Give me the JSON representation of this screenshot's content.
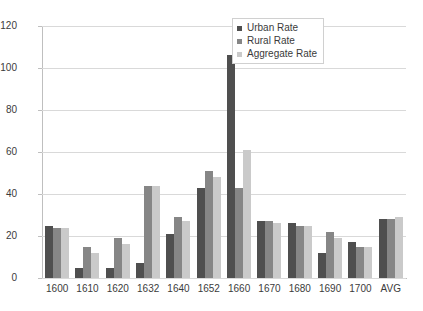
{
  "chart_data": {
    "type": "bar",
    "title": "",
    "xlabel": "",
    "ylabel": "",
    "ylim": [
      0,
      120
    ],
    "yticks": [
      0,
      20,
      40,
      60,
      80,
      100,
      120
    ],
    "grid": true,
    "legend_position": "top-right",
    "categories": [
      "1600",
      "1610",
      "1620",
      "1632",
      "1640",
      "1652",
      "1660",
      "1670",
      "1680",
      "1690",
      "1700",
      "AVG"
    ],
    "series": [
      {
        "name": "Urban Rate",
        "color": "#4f4f4f",
        "values": [
          25,
          5,
          5,
          7,
          21,
          43,
          106,
          27,
          26,
          12,
          17,
          28
        ]
      },
      {
        "name": "Rural Rate",
        "color": "#868686",
        "values": [
          24,
          15,
          19,
          44,
          29,
          51,
          43,
          27,
          25,
          22,
          15,
          28
        ]
      },
      {
        "name": "Aggregate Rate",
        "color": "#cacaca",
        "values": [
          24,
          12,
          16,
          44,
          27,
          48,
          61,
          26,
          25,
          19,
          15,
          29
        ]
      }
    ]
  }
}
